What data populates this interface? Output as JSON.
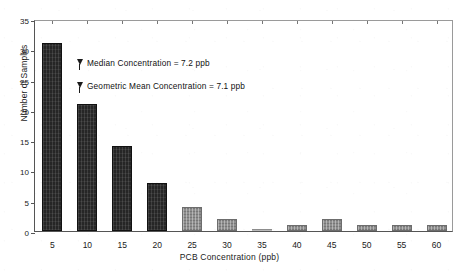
{
  "chart_data": {
    "type": "bar",
    "title": "",
    "xlabel": "PCB Concentration (ppb)",
    "ylabel": "Number of Samples",
    "categories": [
      "5",
      "10",
      "15",
      "20",
      "25",
      "30",
      "35",
      "40",
      "45",
      "50",
      "55",
      "60"
    ],
    "values": [
      31,
      21,
      14,
      8,
      4,
      2,
      0,
      1,
      2,
      1,
      1,
      1
    ],
    "xtick_labels": [
      "5",
      "10",
      "15",
      "20",
      "25",
      "30",
      "35",
      "40",
      "45",
      "50",
      "55",
      "60"
    ],
    "ytick_labels": [
      "0",
      "5",
      "10",
      "15",
      "20",
      "25",
      "30",
      "35"
    ],
    "ytick_values": [
      0,
      5,
      10,
      15,
      20,
      25,
      30,
      35
    ],
    "ylim": [
      0,
      35
    ],
    "grid": false,
    "legend": "none",
    "bar_styles": [
      "dark",
      "dark",
      "dark",
      "dark",
      "light",
      "light",
      "sliver",
      "light",
      "light",
      "light",
      "light",
      "light"
    ],
    "annotations": [
      {
        "text": "Median Concentration = 7.2 ppb",
        "marker": "down-pin",
        "x_value": 7.2,
        "value": "7.2 ppb"
      },
      {
        "text": "Geometric Mean Concentration = 7.1 ppb",
        "marker": "down-pin",
        "x_value": 7.1,
        "value": "7.1 ppb"
      }
    ],
    "colors": {
      "bar_dark": "#262626",
      "bar_light": "#8e8e8e",
      "axis": "#555555",
      "text": "#111111",
      "background": "#ffffff"
    }
  }
}
